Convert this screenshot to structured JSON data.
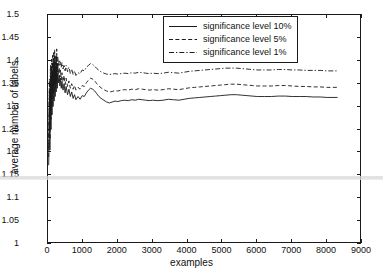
{
  "chart_data": {
    "type": "line",
    "title": "",
    "xlabel": "examples",
    "ylabel": "average number of labels",
    "xlim": [
      0,
      9000
    ],
    "ylim": [
      1,
      1.5
    ],
    "xticks": [
      0,
      1000,
      2000,
      3000,
      4000,
      5000,
      6000,
      7000,
      8000,
      9000
    ],
    "xtick_labels": [
      "0",
      "1000",
      "2000",
      "3000",
      "4000",
      "5000",
      "6000",
      "7000",
      "8000",
      "9000"
    ],
    "yticks": [
      1,
      1.05,
      1.1,
      1.15,
      1.2,
      1.25,
      1.3,
      1.35,
      1.4,
      1.45,
      1.5
    ],
    "ytick_labels": [
      "1",
      "1.05",
      "1.1",
      "1.15",
      "1.2",
      "1.25",
      "1.3",
      "1.35",
      "1.4",
      "1.45",
      "1.5"
    ],
    "grid": false,
    "legend_position": "upper center-right",
    "series": [
      {
        "name": "significance level 10%",
        "style": "solid",
        "color": "#1a1a1a",
        "x": [
          20,
          40,
          55,
          70,
          85,
          100,
          115,
          130,
          145,
          160,
          175,
          190,
          205,
          220,
          235,
          250,
          265,
          280,
          300,
          320,
          340,
          360,
          380,
          400,
          430,
          460,
          490,
          520,
          560,
          600,
          640,
          680,
          720,
          760,
          800,
          860,
          920,
          980,
          1040,
          1100,
          1160,
          1220,
          1280,
          1340,
          1400,
          1460,
          1520,
          1600,
          1680,
          1760,
          1840,
          1920,
          2000,
          2100,
          2200,
          2300,
          2400,
          2500,
          2600,
          2700,
          2800,
          2900,
          3000,
          3150,
          3300,
          3450,
          3600,
          3750,
          3900,
          4050,
          4200,
          4350,
          4500,
          4650,
          4800,
          4950,
          5100,
          5250,
          5400,
          5550,
          5700,
          5850,
          6000,
          6200,
          6400,
          6600,
          6800,
          7000,
          7200,
          7400,
          7600,
          7800,
          8000,
          8200,
          8300
        ],
        "y": [
          1.172,
          1.318,
          1.205,
          1.352,
          1.25,
          1.368,
          1.282,
          1.375,
          1.3,
          1.386,
          1.312,
          1.392,
          1.322,
          1.378,
          1.332,
          1.395,
          1.34,
          1.372,
          1.352,
          1.368,
          1.345,
          1.362,
          1.34,
          1.355,
          1.336,
          1.35,
          1.33,
          1.344,
          1.326,
          1.338,
          1.322,
          1.332,
          1.318,
          1.326,
          1.315,
          1.322,
          1.316,
          1.324,
          1.322,
          1.33,
          1.336,
          1.34,
          1.338,
          1.334,
          1.328,
          1.322,
          1.318,
          1.314,
          1.31,
          1.308,
          1.31,
          1.312,
          1.311,
          1.313,
          1.314,
          1.313,
          1.315,
          1.314,
          1.316,
          1.315,
          1.314,
          1.313,
          1.314,
          1.313,
          1.314,
          1.316,
          1.315,
          1.314,
          1.316,
          1.318,
          1.319,
          1.32,
          1.321,
          1.322,
          1.323,
          1.324,
          1.325,
          1.326,
          1.326,
          1.325,
          1.324,
          1.323,
          1.322,
          1.322,
          1.322,
          1.323,
          1.323,
          1.322,
          1.322,
          1.322,
          1.321,
          1.321,
          1.32,
          1.32,
          1.32
        ]
      },
      {
        "name": "significance level 5%",
        "style": "dashed",
        "color": "#1a1a1a",
        "x": [
          20,
          40,
          55,
          70,
          85,
          100,
          115,
          130,
          145,
          160,
          175,
          190,
          205,
          220,
          235,
          250,
          265,
          280,
          300,
          320,
          340,
          360,
          380,
          400,
          430,
          460,
          490,
          520,
          560,
          600,
          640,
          680,
          720,
          760,
          800,
          860,
          920,
          980,
          1040,
          1100,
          1160,
          1220,
          1280,
          1340,
          1400,
          1460,
          1520,
          1600,
          1680,
          1760,
          1840,
          1920,
          2000,
          2100,
          2200,
          2300,
          2400,
          2500,
          2600,
          2700,
          2800,
          2900,
          3000,
          3150,
          3300,
          3450,
          3600,
          3750,
          3900,
          4050,
          4200,
          4350,
          4500,
          4650,
          4800,
          4950,
          5100,
          5250,
          5400,
          5550,
          5700,
          5850,
          6000,
          6200,
          6400,
          6600,
          6800,
          7000,
          7200,
          7400,
          7600,
          7800,
          8000,
          8200,
          8300
        ],
        "y": [
          1.19,
          1.34,
          1.228,
          1.372,
          1.272,
          1.388,
          1.3,
          1.396,
          1.318,
          1.404,
          1.33,
          1.41,
          1.34,
          1.398,
          1.35,
          1.414,
          1.358,
          1.392,
          1.37,
          1.386,
          1.364,
          1.38,
          1.358,
          1.374,
          1.354,
          1.368,
          1.348,
          1.362,
          1.344,
          1.356,
          1.34,
          1.35,
          1.338,
          1.346,
          1.336,
          1.342,
          1.338,
          1.346,
          1.344,
          1.352,
          1.358,
          1.362,
          1.36,
          1.356,
          1.35,
          1.345,
          1.341,
          1.337,
          1.334,
          1.332,
          1.333,
          1.335,
          1.334,
          1.336,
          1.337,
          1.336,
          1.338,
          1.337,
          1.339,
          1.338,
          1.337,
          1.336,
          1.337,
          1.336,
          1.337,
          1.339,
          1.338,
          1.337,
          1.339,
          1.341,
          1.342,
          1.343,
          1.344,
          1.345,
          1.346,
          1.347,
          1.348,
          1.349,
          1.349,
          1.348,
          1.347,
          1.346,
          1.345,
          1.345,
          1.345,
          1.346,
          1.346,
          1.345,
          1.344,
          1.344,
          1.343,
          1.343,
          1.342,
          1.342,
          1.342
        ]
      },
      {
        "name": "significance level 1%",
        "style": "dashdot",
        "color": "#1a1a1a",
        "x": [
          20,
          40,
          55,
          70,
          85,
          100,
          115,
          130,
          145,
          160,
          175,
          190,
          205,
          220,
          235,
          250,
          265,
          280,
          300,
          320,
          340,
          360,
          380,
          400,
          430,
          460,
          490,
          520,
          560,
          600,
          640,
          680,
          720,
          760,
          800,
          860,
          920,
          980,
          1040,
          1100,
          1160,
          1220,
          1280,
          1340,
          1400,
          1460,
          1520,
          1600,
          1680,
          1760,
          1840,
          1920,
          2000,
          2100,
          2200,
          2300,
          2400,
          2500,
          2600,
          2700,
          2800,
          2900,
          3000,
          3150,
          3300,
          3450,
          3600,
          3750,
          3900,
          4050,
          4200,
          4350,
          4500,
          4650,
          4800,
          4950,
          5100,
          5250,
          5400,
          5550,
          5700,
          5850,
          6000,
          6200,
          6400,
          6600,
          6800,
          7000,
          7200,
          7400,
          7600,
          7800,
          8000,
          8200,
          8300
        ],
        "y": [
          1.21,
          1.36,
          1.25,
          1.392,
          1.292,
          1.404,
          1.318,
          1.412,
          1.336,
          1.418,
          1.346,
          1.424,
          1.356,
          1.412,
          1.366,
          1.426,
          1.374,
          1.408,
          1.388,
          1.402,
          1.39,
          1.398,
          1.386,
          1.396,
          1.382,
          1.392,
          1.378,
          1.39,
          1.376,
          1.386,
          1.372,
          1.382,
          1.37,
          1.378,
          1.368,
          1.374,
          1.372,
          1.38,
          1.378,
          1.386,
          1.39,
          1.394,
          1.392,
          1.388,
          1.383,
          1.379,
          1.376,
          1.373,
          1.371,
          1.37,
          1.371,
          1.372,
          1.371,
          1.372,
          1.373,
          1.372,
          1.374,
          1.373,
          1.375,
          1.374,
          1.373,
          1.372,
          1.373,
          1.372,
          1.373,
          1.375,
          1.374,
          1.373,
          1.375,
          1.377,
          1.378,
          1.379,
          1.38,
          1.381,
          1.382,
          1.383,
          1.384,
          1.384,
          1.384,
          1.383,
          1.382,
          1.381,
          1.38,
          1.38,
          1.38,
          1.381,
          1.381,
          1.38,
          1.38,
          1.379,
          1.379,
          1.379,
          1.378,
          1.378,
          1.378
        ]
      }
    ]
  },
  "legend": {
    "entries": [
      {
        "label": "significance level 10%",
        "style": "solid"
      },
      {
        "label": "significance level 5%",
        "style": "dashed"
      },
      {
        "label": "significance level 1%",
        "style": "dashdot"
      }
    ]
  },
  "colors": {
    "axis": "#1a1a1a",
    "line": "#1a1a1a",
    "background": "#ffffff",
    "artifact": "#d8d8d8"
  }
}
